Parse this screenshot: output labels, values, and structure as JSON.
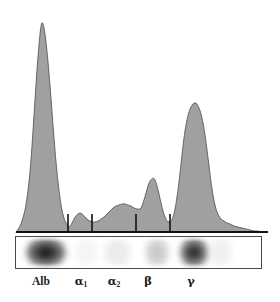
{
  "figure": {
    "type": "serum-protein-electrophoresis-densitometry",
    "background_color": "#ffffff",
    "curve_fill_color": "#a0a0a0",
    "curve_stroke_color": "#585858",
    "baseline_color": "#111111",
    "divider_color": "#111111",
    "strip_border_color": "#4a4a4a"
  },
  "labels": [
    {
      "id": "alb",
      "text": "Alb",
      "sub": "",
      "x": 41
    },
    {
      "id": "alpha1",
      "text": "α",
      "sub": "1",
      "x": 81
    },
    {
      "id": "alpha2",
      "text": "α",
      "sub": "2",
      "x": 114
    },
    {
      "id": "beta",
      "text": "β",
      "sub": "",
      "x": 148
    },
    {
      "id": "gamma",
      "text": "γ",
      "sub": "",
      "x": 191
    }
  ],
  "fraction_dividers": {
    "description": "vertical tick lines separating electrophoretic fractions",
    "x_positions": [
      68,
      92,
      136,
      170
    ],
    "y_top": 214,
    "y_bottom": 232
  },
  "gel": {
    "left": 15,
    "top": 236,
    "width": 247,
    "height": 33,
    "bands": [
      {
        "name": "albumin-band",
        "left_pct": 4.0,
        "width_pct": 16.5,
        "darkness": 0.97
      },
      {
        "name": "alpha1-band",
        "left_pct": 24.0,
        "width_pct": 9.0,
        "darkness": 0.17
      },
      {
        "name": "alpha2-band",
        "left_pct": 36.0,
        "width_pct": 11.0,
        "darkness": 0.26
      },
      {
        "name": "beta-band",
        "left_pct": 52.5,
        "width_pct": 10.0,
        "darkness": 0.46
      },
      {
        "name": "gamma-band",
        "left_pct": 67.0,
        "width_pct": 11.5,
        "darkness": 0.93
      },
      {
        "name": "gamma-tail-band",
        "left_pct": 79.0,
        "width_pct": 9.0,
        "darkness": 0.22
      }
    ]
  },
  "chart_data": {
    "type": "area",
    "title": "",
    "xlabel": "",
    "ylabel": "",
    "x_unit": "px",
    "y_unit": "px (screen, y down)",
    "baseline_y": 232,
    "x_range": [
      16,
      268
    ],
    "axis_line": {
      "x1": 16,
      "x2": 268,
      "y": 232
    },
    "series": [
      {
        "name": "densitometry-trace",
        "fill": "#a0a0a0",
        "stroke": "#585858",
        "points": [
          [
            16,
            232
          ],
          [
            19,
            228
          ],
          [
            22,
            221
          ],
          [
            25,
            210
          ],
          [
            27,
            198
          ],
          [
            29,
            182
          ],
          [
            31,
            160
          ],
          [
            33,
            131
          ],
          [
            35,
            100
          ],
          [
            37,
            70
          ],
          [
            39,
            45
          ],
          [
            40.5,
            30
          ],
          [
            41.5,
            24
          ],
          [
            42.5,
            23
          ],
          [
            44,
            28
          ],
          [
            46,
            42
          ],
          [
            48,
            62
          ],
          [
            50,
            86
          ],
          [
            52,
            112
          ],
          [
            54,
            138
          ],
          [
            56,
            162
          ],
          [
            58,
            182
          ],
          [
            60,
            198
          ],
          [
            62,
            210
          ],
          [
            64,
            218
          ],
          [
            66,
            223
          ],
          [
            68,
            226
          ],
          [
            70,
            226
          ],
          [
            72,
            223
          ],
          [
            74,
            219
          ],
          [
            76,
            216
          ],
          [
            78,
            214
          ],
          [
            80,
            213
          ],
          [
            82,
            214
          ],
          [
            84,
            216
          ],
          [
            86,
            218
          ],
          [
            88,
            220
          ],
          [
            90,
            221
          ],
          [
            92,
            222
          ],
          [
            95,
            222
          ],
          [
            98,
            221
          ],
          [
            101,
            219
          ],
          [
            104,
            217
          ],
          [
            107,
            214
          ],
          [
            110,
            211
          ],
          [
            113,
            208
          ],
          [
            116,
            206
          ],
          [
            119,
            205
          ],
          [
            122,
            204
          ],
          [
            125,
            204
          ],
          [
            128,
            205
          ],
          [
            131,
            206
          ],
          [
            134,
            208
          ],
          [
            137,
            209
          ],
          [
            140,
            209
          ],
          [
            142,
            206
          ],
          [
            144,
            200
          ],
          [
            146,
            193
          ],
          [
            148,
            186
          ],
          [
            150,
            181
          ],
          [
            152,
            179
          ],
          [
            153,
            178
          ],
          [
            155,
            180
          ],
          [
            157,
            186
          ],
          [
            159,
            194
          ],
          [
            161,
            203
          ],
          [
            163,
            211
          ],
          [
            165,
            217
          ],
          [
            167,
            221
          ],
          [
            169,
            222
          ],
          [
            171,
            221
          ],
          [
            173,
            217
          ],
          [
            175,
            209
          ],
          [
            177,
            197
          ],
          [
            179,
            182
          ],
          [
            181,
            164
          ],
          [
            183,
            146
          ],
          [
            185,
            131
          ],
          [
            187,
            120
          ],
          [
            189,
            112
          ],
          [
            191,
            107
          ],
          [
            193,
            104
          ],
          [
            195,
            103
          ],
          [
            197,
            104
          ],
          [
            199,
            108
          ],
          [
            201,
            114
          ],
          [
            203,
            123
          ],
          [
            205,
            135
          ],
          [
            207,
            150
          ],
          [
            209,
            166
          ],
          [
            211,
            182
          ],
          [
            213,
            195
          ],
          [
            215,
            205
          ],
          [
            217,
            212
          ],
          [
            219,
            216
          ],
          [
            221,
            219
          ],
          [
            224,
            221
          ],
          [
            227,
            223
          ],
          [
            230,
            224
          ],
          [
            234,
            226
          ],
          [
            238,
            227
          ],
          [
            242,
            228
          ],
          [
            246,
            229
          ],
          [
            250,
            230
          ],
          [
            254,
            231
          ],
          [
            258,
            231
          ],
          [
            262,
            232
          ],
          [
            268,
            232
          ]
        ]
      }
    ],
    "peaks": [
      {
        "name": "Alb",
        "apex_x": 42,
        "apex_y": 23,
        "height_px": 209
      },
      {
        "name": "α1",
        "apex_x": 80,
        "apex_y": 213,
        "height_px": 19
      },
      {
        "name": "α2",
        "apex_x": 122,
        "apex_y": 204,
        "height_px": 28
      },
      {
        "name": "β",
        "apex_x": 153,
        "apex_y": 178,
        "height_px": 54
      },
      {
        "name": "γ",
        "apex_x": 195,
        "apex_y": 103,
        "height_px": 129
      }
    ],
    "grid": false,
    "legend": "none"
  }
}
